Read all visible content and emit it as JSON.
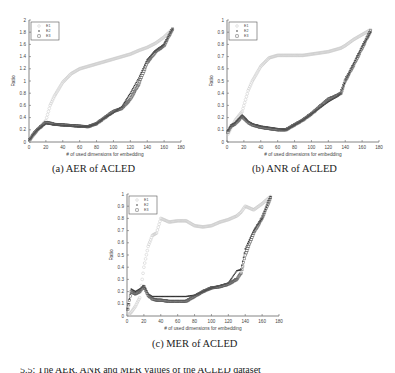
{
  "figure": {
    "captions": [
      "(a) AER of ACLED",
      "(b) ANR of ACLED",
      "(c) MER of ACLED"
    ],
    "bottom_caption_partial": "5.5: The AER, ANR and MER values of the ACLED dataset"
  },
  "chart_data": [
    {
      "type": "scatter",
      "title": "(a) AER of ACLED",
      "xlabel": "# of used dimensions for embedding",
      "ylabel": "Ratio",
      "xlim": [
        0,
        180
      ],
      "ylim": [
        0,
        2
      ],
      "xticks": [
        0,
        20,
        40,
        60,
        80,
        100,
        120,
        140,
        160,
        180
      ],
      "yticks": [
        0,
        0.2,
        0.4,
        0.6,
        0.8,
        1,
        1.2,
        1.4,
        1.6,
        1.8,
        2
      ],
      "legend": [
        "E_1",
        "E_2",
        "E_3"
      ],
      "legend_position": "upper left",
      "grid": false,
      "x": [
        0,
        5,
        10,
        20,
        25,
        30,
        40,
        50,
        60,
        70,
        80,
        90,
        100,
        110,
        120,
        130,
        140,
        150,
        160,
        170
      ],
      "series": [
        {
          "name": "E_1",
          "marker": "circle-light",
          "values": [
            0.02,
            0.1,
            0.2,
            0.35,
            0.6,
            0.75,
            0.98,
            1.12,
            1.2,
            1.24,
            1.28,
            1.32,
            1.36,
            1.4,
            1.44,
            1.5,
            1.55,
            1.62,
            1.72,
            1.85
          ]
        },
        {
          "name": "E_2",
          "marker": "dot-dark",
          "values": [
            0.02,
            0.12,
            0.2,
            0.3,
            0.29,
            0.28,
            0.27,
            0.26,
            0.25,
            0.25,
            0.3,
            0.4,
            0.48,
            0.58,
            0.8,
            1.05,
            1.35,
            1.5,
            1.6,
            1.85
          ]
        },
        {
          "name": "E_3",
          "marker": "square-dark",
          "values": [
            0.02,
            0.12,
            0.2,
            0.32,
            0.31,
            0.29,
            0.28,
            0.27,
            0.26,
            0.25,
            0.3,
            0.4,
            0.5,
            0.55,
            0.7,
            0.95,
            1.3,
            1.48,
            1.58,
            1.85
          ]
        }
      ]
    },
    {
      "type": "scatter",
      "title": "(b) ANR of ACLED",
      "xlabel": "# of used dimensions for embedding",
      "ylabel": "Ratio",
      "xlim": [
        0,
        180
      ],
      "ylim": [
        0,
        1
      ],
      "xticks": [
        0,
        20,
        40,
        60,
        80,
        100,
        120,
        140,
        160,
        180
      ],
      "yticks": [
        0,
        0.1,
        0.2,
        0.3,
        0.4,
        0.5,
        0.6,
        0.7,
        0.8,
        0.9,
        1
      ],
      "legend": [
        "E_1",
        "E_2",
        "E_3"
      ],
      "legend_position": "upper left",
      "grid": false,
      "x": [
        0,
        5,
        10,
        18,
        25,
        30,
        40,
        50,
        60,
        70,
        80,
        90,
        100,
        110,
        120,
        130,
        135,
        140,
        150,
        160,
        170
      ],
      "series": [
        {
          "name": "E_1",
          "marker": "circle-light",
          "values": [
            0.05,
            0.12,
            0.18,
            0.25,
            0.42,
            0.5,
            0.62,
            0.69,
            0.71,
            0.71,
            0.71,
            0.71,
            0.72,
            0.73,
            0.74,
            0.76,
            0.77,
            0.79,
            0.84,
            0.88,
            0.92
          ]
        },
        {
          "name": "E_2",
          "marker": "dot-dark",
          "values": [
            0.08,
            0.14,
            0.16,
            0.22,
            0.17,
            0.15,
            0.13,
            0.12,
            0.11,
            0.1,
            0.14,
            0.18,
            0.23,
            0.28,
            0.33,
            0.37,
            0.4,
            0.5,
            0.64,
            0.78,
            0.9
          ]
        },
        {
          "name": "E_3",
          "marker": "square-dark",
          "values": [
            0.07,
            0.13,
            0.15,
            0.21,
            0.16,
            0.14,
            0.12,
            0.11,
            0.1,
            0.1,
            0.14,
            0.18,
            0.23,
            0.29,
            0.35,
            0.38,
            0.4,
            0.5,
            0.63,
            0.77,
            0.91
          ]
        }
      ]
    },
    {
      "type": "scatter",
      "title": "(c) MER of ACLED",
      "xlabel": "# of used dimensions for embedding",
      "ylabel": "Ratio",
      "xlim": [
        0,
        180
      ],
      "ylim": [
        0,
        1
      ],
      "xticks": [
        0,
        20,
        40,
        60,
        80,
        100,
        120,
        140,
        160,
        180
      ],
      "yticks": [
        0,
        0.1,
        0.2,
        0.3,
        0.4,
        0.5,
        0.6,
        0.7,
        0.8,
        0.9,
        1
      ],
      "legend": [
        "E_1",
        "E_2",
        "E_3"
      ],
      "legend_position": "upper left",
      "grid": false,
      "x": [
        0,
        5,
        10,
        15,
        20,
        25,
        30,
        35,
        40,
        50,
        60,
        70,
        80,
        90,
        100,
        110,
        120,
        130,
        135,
        140,
        150,
        160,
        170
      ],
      "series": [
        {
          "name": "E_1",
          "marker": "circle-light",
          "values": [
            0.0,
            0.03,
            0.08,
            0.15,
            0.4,
            0.57,
            0.66,
            0.68,
            0.8,
            0.77,
            0.78,
            0.78,
            0.74,
            0.73,
            0.74,
            0.77,
            0.79,
            0.82,
            0.85,
            0.9,
            0.87,
            0.92,
            0.98
          ]
        },
        {
          "name": "E_2",
          "marker": "dot-dark",
          "values": [
            0.02,
            0.22,
            0.2,
            0.22,
            0.25,
            0.18,
            0.16,
            0.16,
            0.16,
            0.16,
            0.16,
            0.16,
            0.17,
            0.2,
            0.23,
            0.25,
            0.27,
            0.37,
            0.38,
            0.55,
            0.7,
            0.8,
            0.98
          ]
        },
        {
          "name": "E_3",
          "marker": "square-dark",
          "values": [
            0.02,
            0.2,
            0.18,
            0.2,
            0.24,
            0.17,
            0.14,
            0.13,
            0.13,
            0.12,
            0.12,
            0.12,
            0.16,
            0.2,
            0.23,
            0.24,
            0.26,
            0.3,
            0.35,
            0.5,
            0.68,
            0.8,
            0.97
          ]
        }
      ]
    }
  ]
}
